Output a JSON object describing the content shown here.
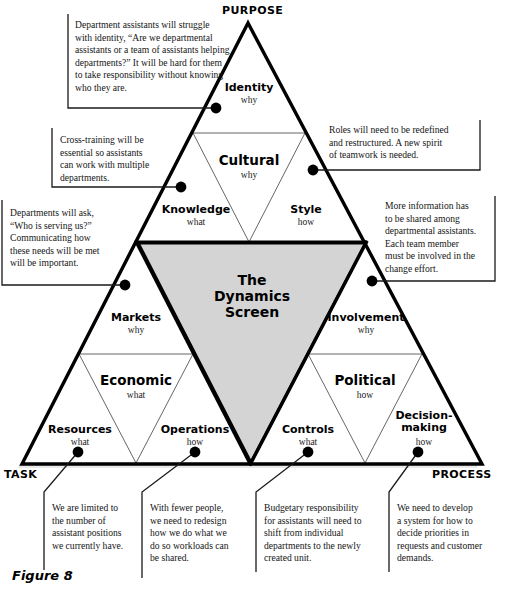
{
  "figure": {
    "caption": "Figure 8",
    "center_title": "The\nDynamics\nScreen"
  },
  "corner_labels": {
    "top": "PURPOSE",
    "bottom_left": "TASK",
    "bottom_right": "PROCESS"
  },
  "cells": [
    {
      "id": "identity",
      "name": "Identity",
      "question": "why"
    },
    {
      "id": "cultural",
      "name": "Cultural",
      "question": "why"
    },
    {
      "id": "knowledge",
      "name": "Knowledge",
      "question": "what"
    },
    {
      "id": "style",
      "name": "Style",
      "question": "how"
    },
    {
      "id": "markets",
      "name": "Markets",
      "question": "why"
    },
    {
      "id": "involvement",
      "name": "Involvement",
      "question": "why"
    },
    {
      "id": "economic",
      "name": "Economic",
      "question": "what"
    },
    {
      "id": "political",
      "name": "Political",
      "question": "how"
    },
    {
      "id": "resources",
      "name": "Resources",
      "question": "what"
    },
    {
      "id": "operations",
      "name": "Operations",
      "question": "how"
    },
    {
      "id": "controls",
      "name": "Controls",
      "question": "what"
    },
    {
      "id": "decision-making",
      "name": "Decision-\nmaking",
      "question": "how"
    }
  ],
  "callouts": [
    {
      "id": "identity-note",
      "text": "Department assistants will struggle\nwith identity, “Are we departmental\nassistants or a team of assistants helping\ndepartments?” It will be hard for them\nto take responsibility without knowing\nwho they are."
    },
    {
      "id": "knowledge-note",
      "text": "Cross-training will be\nessential so assistants\ncan work with multiple\ndepartments."
    },
    {
      "id": "style-note",
      "text": "Roles will need to be redefined\nand restructured. A new spirit\nof teamwork is needed."
    },
    {
      "id": "markets-note",
      "text": "Departments will ask,\n“Who is serving us?”\nCommunicating how\nthese needs will be met\nwill be important."
    },
    {
      "id": "involvement-note",
      "text": "More information has\nto be shared among\ndepartmental assistants.\nEach team member\nmust be involved in the\nchange effort."
    },
    {
      "id": "resources-note",
      "text": "We are limited to\nthe number of\nassistant positions\nwe currently have."
    },
    {
      "id": "operations-note",
      "text": "With fewer people,\nwe need to redesign\nhow we do what we\ndo so workloads can\nbe shared."
    },
    {
      "id": "controls-note",
      "text": "Budgetary responsibility\nfor assistants will need to\nshift from individual\ndepartments to the newly\ncreated unit."
    },
    {
      "id": "decision-note",
      "text": "We need to develop\na system for how to\ndecide priorities in\nrequests and customer\ndemands."
    }
  ],
  "colors": {
    "screen_fill": "#d4d4d4",
    "line": "#000000",
    "thin_line": "#444444",
    "text": "#151515"
  }
}
